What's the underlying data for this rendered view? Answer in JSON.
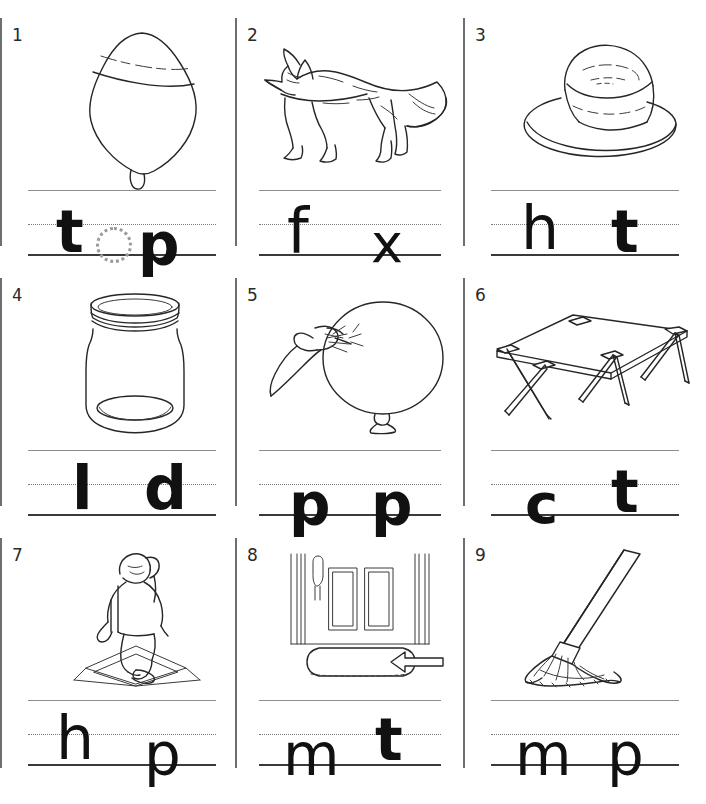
{
  "worksheet": {
    "title": "Beginning and Ending Sounds Worksheet",
    "columns": 3,
    "rows": 3,
    "line_style": {
      "top_line": "solid-grey",
      "middle_line": "dotted",
      "bottom_line": "solid-dark"
    }
  },
  "items": [
    {
      "number": "1",
      "picture": "spinning-top",
      "word": "top",
      "letters": [
        {
          "char": "t",
          "slot": 1,
          "filled": true
        },
        {
          "char": "o",
          "slot": 2,
          "filled": false,
          "trace": true
        },
        {
          "char": "p",
          "slot": 3,
          "filled": true
        }
      ]
    },
    {
      "number": "2",
      "picture": "fox",
      "word": "fox",
      "letters": [
        {
          "char": "f",
          "slot": 1,
          "filled": true
        },
        {
          "char": "x",
          "slot": 3,
          "filled": true
        }
      ]
    },
    {
      "number": "3",
      "picture": "hat",
      "word": "hat",
      "letters": [
        {
          "char": "h",
          "slot": 1,
          "filled": true
        },
        {
          "char": "t",
          "slot": 3,
          "filled": true
        }
      ]
    },
    {
      "number": "4",
      "picture": "jar",
      "word": "lid",
      "letters": [
        {
          "char": "l",
          "slot": 1,
          "filled": true
        },
        {
          "char": "d",
          "slot": 3,
          "filled": true
        }
      ]
    },
    {
      "number": "5",
      "picture": "hand-popping-balloon",
      "word": "pop",
      "letters": [
        {
          "char": "p",
          "slot": 1,
          "filled": true
        },
        {
          "char": "p",
          "slot": 3,
          "filled": true
        }
      ]
    },
    {
      "number": "6",
      "picture": "cot",
      "word": "cot",
      "letters": [
        {
          "char": "c",
          "slot": 1,
          "filled": true
        },
        {
          "char": "t",
          "slot": 3,
          "filled": true
        }
      ]
    },
    {
      "number": "7",
      "picture": "child-hopping-on-base",
      "word": "hop",
      "letters": [
        {
          "char": "h",
          "slot": 1,
          "filled": true
        },
        {
          "char": "p",
          "slot": 3,
          "filled": true
        }
      ]
    },
    {
      "number": "8",
      "picture": "door-with-mat",
      "word": "mat",
      "letters": [
        {
          "char": "m",
          "slot": 1,
          "filled": true
        },
        {
          "char": "t",
          "slot": 3,
          "filled": true
        }
      ]
    },
    {
      "number": "9",
      "picture": "mop",
      "word": "mop",
      "letters": [
        {
          "char": "m",
          "slot": 1,
          "filled": true
        },
        {
          "char": "p",
          "slot": 3,
          "filled": true
        }
      ]
    }
  ],
  "colors": {
    "ink": "#262626",
    "line_dark": "#3a3a3a",
    "line_light": "#8d8d8d",
    "trace_grey": "#9a9a9a",
    "divider": "#6e6e6e",
    "page": "#ffffff"
  }
}
